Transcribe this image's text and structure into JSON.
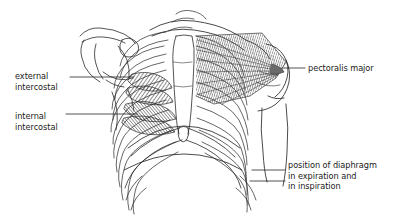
{
  "figure": {
    "background_color": "#ffffff",
    "ink_color": "#1a1a1a",
    "width": 400,
    "height": 216
  },
  "labels": {
    "external_intercostal": {
      "line1": "external",
      "line2": "intercostal"
    },
    "internal_intercostal": {
      "line1": "internal",
      "line2": "intercostal"
    },
    "pectoralis_major": {
      "line1": "pectoralis major"
    },
    "diaphragm": {
      "line1": "position of diaphragm",
      "line2": "in expiration and",
      "line3": "in inspiration"
    }
  },
  "structures": [
    "clavicle",
    "scapula",
    "coracoid-process",
    "humerus",
    "sternum",
    "rib-cage",
    "costal-margin",
    "external-intercostal-muscle",
    "internal-intercostal-muscle",
    "pectoralis-major-muscle",
    "diaphragm-expiration-dome",
    "diaphragm-inspiration-dome"
  ]
}
